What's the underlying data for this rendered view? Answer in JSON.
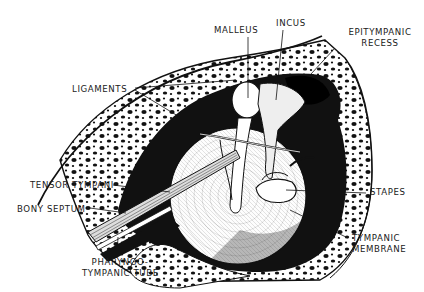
{
  "diagram": {
    "colors": {
      "ink": "#111111",
      "paper": "#ffffff",
      "shade": "#2a2a2a"
    },
    "labels": {
      "malleus": "MALLEUS",
      "incus": "INCUS",
      "epitympanic_1": "EPITYMPANIC",
      "epitympanic_2": "RECESS",
      "ligaments": "LIGAMENTS",
      "tensor_tympani": "TENSOR TYMPANI",
      "bony_septum": "BONY SEPTUM",
      "stapes": "STAPES",
      "tympanic_membrane_1": "TYMPANIC",
      "tympanic_membrane_2": "MEMBRANE",
      "pharyngo_1": "PHARYNGO-",
      "pharyngo_2": "TYMPANIC TUBE"
    }
  }
}
